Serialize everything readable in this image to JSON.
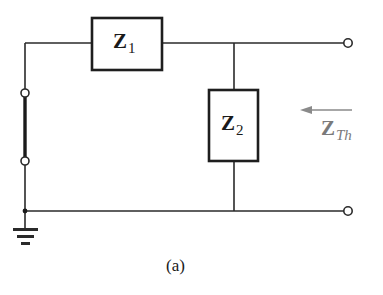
{
  "figure": {
    "caption": "(a)",
    "components": [
      {
        "id": "Z1",
        "symbol": "Z",
        "subscript": "1",
        "type": "impedance",
        "connection": "series"
      },
      {
        "id": "Z2",
        "symbol": "Z",
        "subscript": "2",
        "type": "impedance",
        "connection": "shunt"
      }
    ],
    "thevenin_label": {
      "symbol": "Z",
      "subscript": "Th"
    },
    "arrow_direction": "left",
    "colors": {
      "line": "#2a2a2a",
      "thevenin_label": "#7a7a7a"
    }
  }
}
